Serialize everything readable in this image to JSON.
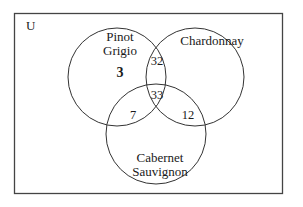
{
  "diagram": {
    "type": "venn",
    "universe_label": "U",
    "sets": [
      {
        "name": "Pinot Grigio",
        "label_lines": [
          "Pinot",
          "Grigio"
        ]
      },
      {
        "name": "Chardonnay",
        "label_lines": [
          "Chardonnay"
        ]
      },
      {
        "name": "Cabernet Sauvignon",
        "label_lines": [
          "Cabernet",
          "Sauvignon"
        ]
      }
    ],
    "regions": {
      "pinot_only": "3",
      "pinot_chardonnay_only": "32",
      "all_three": "33",
      "pinot_cabernet_only": "7",
      "chardonnay_cabernet_only": "12"
    },
    "colors": {
      "stroke": "#333333",
      "text": "#1a1a1a",
      "background": "#ffffff"
    }
  }
}
